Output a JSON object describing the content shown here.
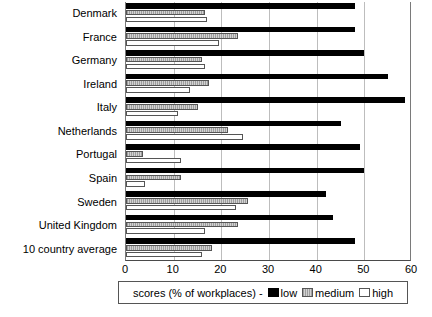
{
  "chart_data": {
    "type": "bar",
    "orientation": "horizontal",
    "title": "",
    "xlabel": "",
    "ylabel": "",
    "xlim": [
      0,
      60
    ],
    "xticks": [
      0,
      10,
      20,
      30,
      40,
      50,
      60
    ],
    "grid": true,
    "legend_position": "bottom",
    "legend_title": "scores (% of workplaces) -",
    "categories": [
      "Denmark",
      "France",
      "Germany",
      "Ireland",
      "Italy",
      "Netherlands",
      "Portugal",
      "Spain",
      "Sweden",
      "United Kingdom",
      "10 country average"
    ],
    "series": [
      {
        "name": "low",
        "color": "#000000",
        "values": [
          48,
          48,
          50,
          55,
          58.5,
          45,
          49,
          50,
          42,
          43.5,
          48
        ]
      },
      {
        "name": "medium",
        "color": "#b4b4b4",
        "values": [
          16.5,
          23.5,
          16,
          17.5,
          15,
          21.5,
          3.5,
          11.5,
          25.5,
          23.5,
          18
        ]
      },
      {
        "name": "high",
        "color": "#ffffff",
        "values": [
          17,
          19.5,
          16.5,
          13.5,
          11,
          24.5,
          11.5,
          4,
          23,
          16.5,
          16
        ]
      }
    ]
  },
  "axis": {
    "tick_labels": [
      "0",
      "10",
      "20",
      "30",
      "40",
      "50",
      "60"
    ]
  },
  "legend": {
    "title": "scores (% of workplaces) -",
    "items": [
      {
        "label": "low"
      },
      {
        "label": "medium"
      },
      {
        "label": "high"
      }
    ]
  }
}
